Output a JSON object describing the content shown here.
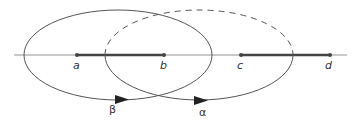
{
  "diagram": {
    "points": [
      {
        "id": "a",
        "label": "a"
      },
      {
        "id": "b",
        "label": "b"
      },
      {
        "id": "c",
        "label": "c"
      },
      {
        "id": "d",
        "label": "d"
      }
    ],
    "intervals": [
      {
        "from": "a",
        "to": "b"
      },
      {
        "from": "c",
        "to": "d"
      }
    ],
    "contours": [
      {
        "id": "beta",
        "label": "β",
        "style": "solid"
      },
      {
        "id": "alpha",
        "label": "α",
        "style": "solid-bottom, dashed-top"
      }
    ],
    "colors": {
      "line": "#555555",
      "interval": "#444444",
      "text": "#333333"
    }
  }
}
